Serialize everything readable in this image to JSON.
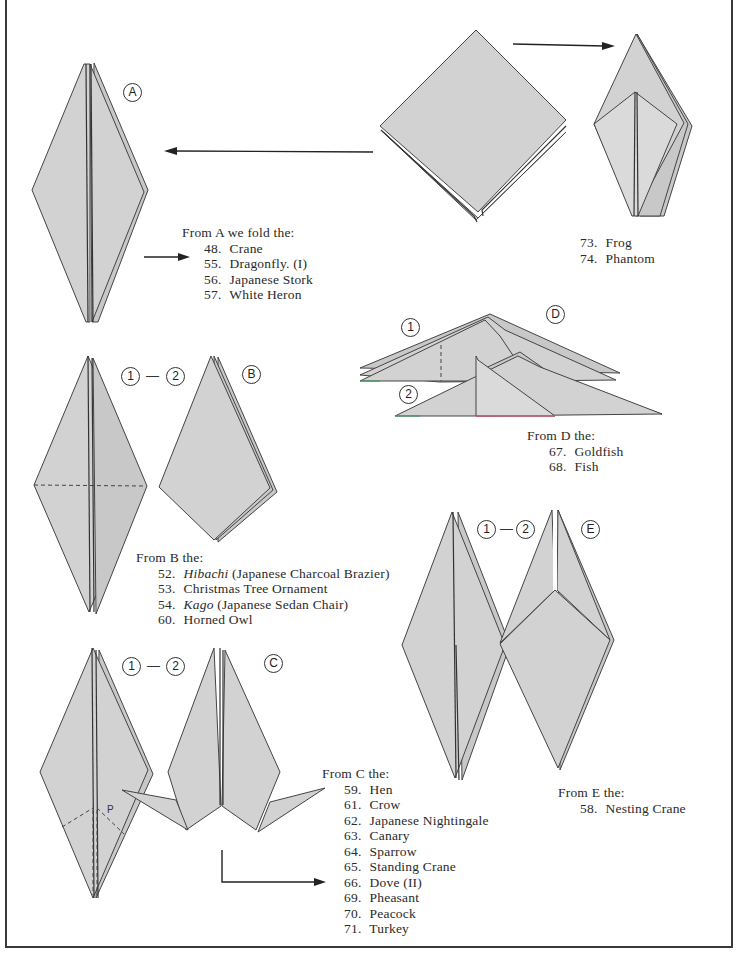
{
  "labels": {
    "A": "A",
    "B": "B",
    "C": "C",
    "D": "D",
    "E": "E",
    "step1": "1",
    "step2": "2",
    "step_sep": "—",
    "point_p": "P"
  },
  "sections": {
    "A": {
      "header": "From A we fold the:",
      "items": [
        {
          "num": "48.",
          "name": "Crane"
        },
        {
          "num": "55.",
          "name": "Dragonfly. (I)"
        },
        {
          "num": "56.",
          "name": "Japanese Stork"
        },
        {
          "num": "57.",
          "name": "White Heron"
        }
      ]
    },
    "top_right": {
      "items": [
        {
          "num": "73.",
          "name": "Frog"
        },
        {
          "num": "74.",
          "name": "Phantom"
        }
      ]
    },
    "B": {
      "header": "From B the:",
      "items": [
        {
          "num": "52.",
          "name_italic": "Hibachi",
          "name": " (Japanese Charcoal Brazier)"
        },
        {
          "num": "53.",
          "name_italic": "",
          "name": "Christmas Tree Ornament"
        },
        {
          "num": "54.",
          "name_italic": "Kago",
          "name": " (Japanese Sedan Chair)"
        },
        {
          "num": "60.",
          "name_italic": "",
          "name": "Horned Owl"
        }
      ]
    },
    "C": {
      "header": "From C the:",
      "items": [
        {
          "num": "59.",
          "name": "Hen"
        },
        {
          "num": "61.",
          "name": "Crow"
        },
        {
          "num": "62.",
          "name": "Japanese Nightingale"
        },
        {
          "num": "63.",
          "name": "Canary"
        },
        {
          "num": "64.",
          "name": "Sparrow"
        },
        {
          "num": "65.",
          "name": "Standing Crane"
        },
        {
          "num": "66.",
          "name": "Dove (II)"
        },
        {
          "num": "69.",
          "name": "Pheasant"
        },
        {
          "num": "70.",
          "name": "Peacock"
        },
        {
          "num": "71.",
          "name": "Turkey"
        }
      ]
    },
    "D": {
      "header": "From D the:",
      "items": [
        {
          "num": "67.",
          "name": "Goldfish"
        },
        {
          "num": "68.",
          "name": "Fish"
        }
      ]
    },
    "E": {
      "header": "From E the:",
      "items": [
        {
          "num": "58.",
          "name": "Nesting Crane"
        }
      ]
    }
  },
  "colors": {
    "paper": "#d2d2d2",
    "outline": "#444444",
    "background": "#ffffff",
    "text": "#2a2a2a",
    "accent_green": "#4a9a6a",
    "accent_red": "#c85a70"
  }
}
